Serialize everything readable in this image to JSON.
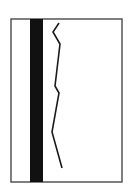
{
  "diagram": {
    "background": "#ffffff",
    "frame": {
      "x": 11,
      "y": 19,
      "width": 111,
      "height": 163,
      "stroke": "#555555",
      "stroke_width": 1.5
    },
    "bar": {
      "x": 30,
      "y": 19,
      "width": 13,
      "height": 163,
      "fill": "#111111"
    },
    "jagged_line": {
      "stroke": "#1a1a1a",
      "stroke_width": 1.6,
      "points": [
        [
          59,
          23
        ],
        [
          53,
          32
        ],
        [
          60,
          44
        ],
        [
          55,
          86
        ],
        [
          59,
          93
        ],
        [
          52,
          132
        ],
        [
          62,
          168
        ]
      ]
    }
  }
}
